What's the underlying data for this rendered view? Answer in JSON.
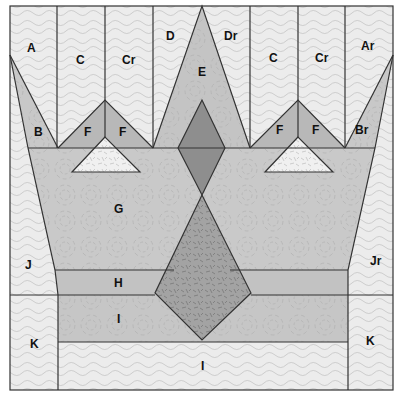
{
  "diagram": {
    "type": "quilt-block-pattern",
    "colors": {
      "background_light": "#ececec",
      "medium_gray": "#c8c8c8",
      "band_gray": "#c2c2c2",
      "triangle_gray": "#b5b5b5",
      "dark_diamond": "#8e8e8e",
      "speckled_kite": "#a3a3a3",
      "white_triangle": "#f0f0f0",
      "outline": "#333333",
      "texture_line": "#bdbdbd"
    },
    "labels": {
      "A": "A",
      "C_left": "C",
      "Cr_left": "Cr",
      "D": "D",
      "Dr": "Dr",
      "C_right": "C",
      "Cr_right": "Cr",
      "Ar": "Ar",
      "E": "E",
      "B": "B",
      "F1": "F",
      "F2": "F",
      "F3": "F",
      "F4": "F",
      "Br": "Br",
      "G": "G",
      "J": "J",
      "Jr": "Jr",
      "H": "H",
      "I_upper": "I",
      "K_left": "K",
      "K_right": "K",
      "I_lower": "I"
    }
  }
}
